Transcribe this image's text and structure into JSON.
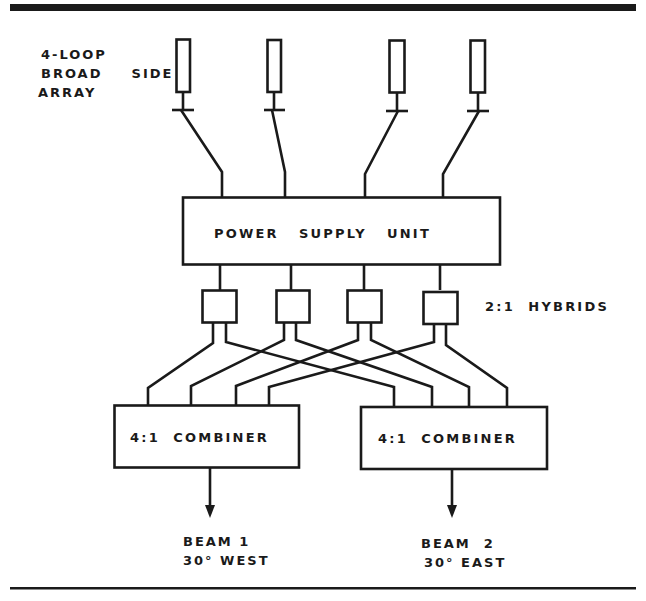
{
  "diagram": {
    "title_label": {
      "line1": "4-LOOP",
      "line2": "BROAD  SIDE",
      "line3": "ARRAY"
    },
    "antennas": [
      {
        "id": "loop-1"
      },
      {
        "id": "loop-2"
      },
      {
        "id": "loop-3"
      },
      {
        "id": "loop-4"
      }
    ],
    "power_supply_unit": {
      "label": "POWER   SUPPLY   UNIT"
    },
    "hybrids": {
      "count": 4,
      "label": "2:1  HYBRIDS"
    },
    "combiners": [
      {
        "label": "4:1  COMBINER"
      },
      {
        "label": "4:1  COMBINER"
      }
    ],
    "outputs": [
      {
        "beam": "BEAM 1",
        "direction": "30° WEST"
      },
      {
        "beam": "BEAM  2",
        "direction": "30° EAST"
      }
    ],
    "colors": {
      "ink": "#1a1a1a",
      "background": "#ffffff"
    }
  }
}
